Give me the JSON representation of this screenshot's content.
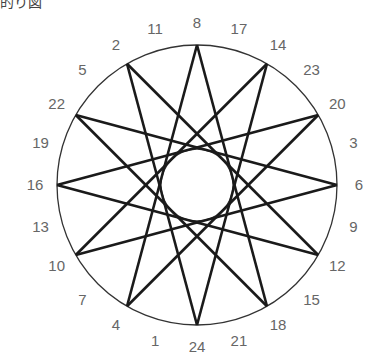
{
  "caption": "的り図",
  "diagram": {
    "type": "star-polygon-on-circle",
    "star": "{12/5}",
    "labels_clockwise_from_top_left": [
      "2",
      "11",
      "8",
      "17",
      "14",
      "23",
      "20",
      "3",
      "6",
      "9",
      "12",
      "15",
      "18",
      "21",
      "24",
      "1",
      "4",
      "7",
      "10",
      "13",
      "16",
      "19",
      "22",
      "5"
    ],
    "top_label": "8",
    "outer_circle": true,
    "inner_circle": true,
    "line_color": "#1a1a1a",
    "label_color": "#666666"
  }
}
